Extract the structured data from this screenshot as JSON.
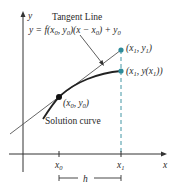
{
  "diagram": {
    "axes": {
      "x_label": "x",
      "y_label": "y"
    },
    "tangent": {
      "heading": "Tangent Line",
      "equation": "y = f(x0, y0)(x − x0) + y0"
    },
    "points": {
      "p0": "(x0, y0)",
      "p1_approx": "(x1, y1)",
      "p1_exact": "(x1, y(x1))"
    },
    "curve_label": "Solution curve",
    "ticks": {
      "x0": "x0",
      "x1": "x1"
    },
    "step_label": "h",
    "colors": {
      "ink": "#222222",
      "accent": "#2e8b9a",
      "line": "#555555"
    }
  }
}
